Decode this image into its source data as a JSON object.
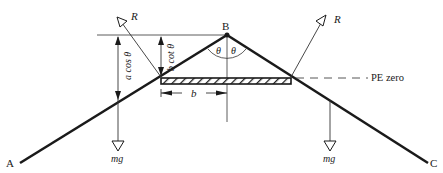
{
  "diagram": {
    "points": {
      "A": "A",
      "B": "B",
      "C": "C"
    },
    "forces": {
      "reaction_left": "R",
      "reaction_right": "R",
      "weight_left": "mg",
      "weight_right": "mg"
    },
    "dimensions": {
      "a_cos_theta": "a cos θ",
      "b_cot_theta": "b cot θ",
      "b": "b"
    },
    "angles": {
      "left": "θ",
      "right": "θ"
    },
    "reference": {
      "pe_zero": "PE zero"
    },
    "colors": {
      "line": "#1a1a1a",
      "thin": "#333333"
    }
  }
}
